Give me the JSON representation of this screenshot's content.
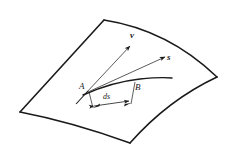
{
  "figure": {
    "stroke_color": "#1a1a1a",
    "background_color": "#ffffff",
    "labels": {
      "velocity_vector": "v",
      "direction_vector": "s",
      "point_a": "A",
      "point_b": "B",
      "arc_length": "ds"
    }
  },
  "geometry": {
    "surface_corners": {
      "top": "104,20",
      "right": "217,77",
      "bottom": "130,143",
      "left": "20,112"
    },
    "point_a_position": "88,90",
    "point_b_position": "134,92",
    "vector_v_tip": "131,47",
    "vector_s_tip": "166,57"
  }
}
